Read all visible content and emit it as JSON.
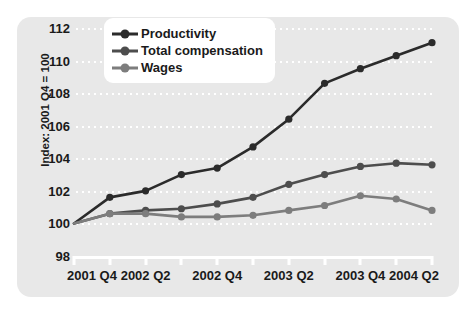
{
  "chart_data": {
    "type": "line",
    "title": "",
    "xlabel": "",
    "ylabel": "Index: 2001 Q4 = 100",
    "ylim": [
      98,
      112
    ],
    "yticks": [
      98,
      100,
      102,
      104,
      106,
      108,
      110,
      112
    ],
    "grid": true,
    "legend_position": "top-left",
    "x": [
      "2001 Q4",
      "2002 Q1",
      "2002 Q2",
      "2002 Q3",
      "2002 Q4",
      "2003 Q1",
      "2003 Q2",
      "2003 Q3",
      "2003 Q4",
      "2004 Q1",
      "2004 Q2"
    ],
    "xtick_labels": [
      "2001 Q4",
      "2002 Q2",
      "2002 Q4",
      "2003 Q2",
      "2003 Q4",
      "2004 Q2"
    ],
    "xtick_indices": [
      0,
      2,
      4,
      6,
      8,
      10
    ],
    "series": [
      {
        "name": "Productivity",
        "color": "#2b2b2b",
        "values": [
          100.0,
          101.6,
          102.0,
          103.0,
          103.4,
          104.7,
          106.4,
          108.6,
          109.5,
          110.3,
          111.1
        ]
      },
      {
        "name": "Total compensation",
        "color": "#4d4d4d",
        "values": [
          100.0,
          100.6,
          100.8,
          100.9,
          101.2,
          101.6,
          102.4,
          103.0,
          103.5,
          103.7,
          103.6
        ]
      },
      {
        "name": "Wages",
        "color": "#7d7d7d",
        "values": [
          100.0,
          100.6,
          100.6,
          100.4,
          100.4,
          100.5,
          100.8,
          101.1,
          101.7,
          101.5,
          100.8
        ]
      }
    ]
  },
  "style": {
    "panel_background": "#e8e8e8",
    "page_background": "#ffffff",
    "gridline_color": "#ffffff",
    "axis_color": "#ffffff",
    "text_color": "#1a1a1a",
    "legend_background": "#ffffff"
  }
}
